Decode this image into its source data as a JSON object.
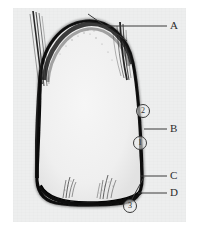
{
  "figure": {
    "kind": "dental-radiograph",
    "caption": "",
    "plate_background": "#edeeee",
    "page_background": "#ffffff",
    "ink_color": "#1a1a1a"
  },
  "labels": [
    {
      "id": "A",
      "text": "A",
      "x": 172,
      "y": 23,
      "leader_from_x": 103,
      "leader_from_y": 26,
      "leader_to_x": 167,
      "leader_to_y": 26
    },
    {
      "id": "B",
      "text": "B",
      "x": 172,
      "y": 126,
      "leader_from_x": 143,
      "leader_from_y": 129,
      "leader_to_x": 167,
      "leader_to_y": 129
    },
    {
      "id": "C",
      "text": "C",
      "x": 172,
      "y": 174,
      "leader_from_x": 143,
      "leader_from_y": 177,
      "leader_to_x": 167,
      "leader_to_y": 177
    },
    {
      "id": "D",
      "text": "D",
      "x": 172,
      "y": 191,
      "leader_from_x": 140,
      "leader_from_y": 194,
      "leader_to_x": 167,
      "leader_to_y": 194
    }
  ],
  "callouts": [
    {
      "id": "2",
      "text": "②",
      "digit": "2",
      "x": 137,
      "y": 108
    },
    {
      "id": "1",
      "text": "①",
      "digit": "1",
      "x": 134,
      "y": 140
    },
    {
      "id": "3",
      "text": "③",
      "digit": "3",
      "x": 124,
      "y": 203
    }
  ],
  "annotation_lines": [
    {
      "name": "a-leader",
      "points": "103,26 167,26"
    },
    {
      "name": "a-diagonal-pointer",
      "points": "88,14 127,41"
    },
    {
      "name": "b-leader",
      "points": "143,129 167,129"
    },
    {
      "name": "c-leader",
      "points": "141,176 167,176"
    },
    {
      "name": "d-leader",
      "points": "138,193 167,193"
    },
    {
      "name": "callout-3-leader",
      "points": "131,200 143,178"
    }
  ],
  "specimen": {
    "name": "tooth-crown-outline",
    "outline_path": "M 40 84 C 40 46 62 23 86 21 C 110 19 128 38 133 63 C 138 88 141 140 142 172 C 143 190 139 201 124 203 C 104 206 72 206 56 203 C 42 200 36 190 37 174 C 38 150 40 110 40 84 Z",
    "interior_fill": "#f1f1f1",
    "edge_color": "#151515"
  }
}
